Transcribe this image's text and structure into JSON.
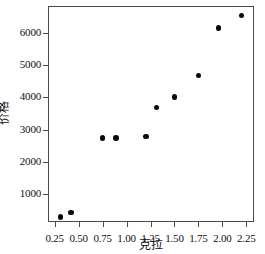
{
  "chart_data": {
    "type": "scatter",
    "title": "",
    "xlabel": "克拉",
    "ylabel": "价格",
    "xlim": [
      0.18,
      2.33
    ],
    "ylim": [
      150,
      6820
    ],
    "grid": false,
    "legend": null,
    "marker": {
      "shape": "circle",
      "color": "#0a0a0a",
      "size": 5.6
    },
    "xticks": [
      0.25,
      0.5,
      0.75,
      1.0,
      1.25,
      1.5,
      1.75,
      2.0,
      2.25
    ],
    "xtick_labels": [
      "0.25",
      "0.50",
      "0.75",
      "1.00",
      "1.25",
      "1.50",
      "1.75",
      "2.00",
      "2.25"
    ],
    "yticks": [
      1000,
      2000,
      3000,
      4000,
      5000,
      6000
    ],
    "ytick_labels": [
      "1000",
      "2000",
      "3000",
      "4000",
      "5000",
      "6000"
    ],
    "x": [
      0.3,
      0.41,
      0.74,
      0.88,
      1.19,
      1.3,
      1.49,
      1.74,
      1.95,
      2.19
    ],
    "y": [
      340,
      470,
      2775,
      2775,
      2825,
      3720,
      4050,
      4700,
      6180,
      6560
    ],
    "points": [
      {
        "x": 0.3,
        "y": 340
      },
      {
        "x": 0.41,
        "y": 470
      },
      {
        "x": 0.74,
        "y": 2775
      },
      {
        "x": 0.88,
        "y": 2775
      },
      {
        "x": 1.19,
        "y": 2825
      },
      {
        "x": 1.3,
        "y": 3720
      },
      {
        "x": 1.49,
        "y": 4050
      },
      {
        "x": 1.74,
        "y": 4700
      },
      {
        "x": 1.95,
        "y": 6180
      },
      {
        "x": 2.19,
        "y": 6560
      }
    ]
  },
  "colors": {
    "background": "#ffffff",
    "frame": "#4a4a4a",
    "marker": "#0a0a0a",
    "text": "#111111"
  }
}
